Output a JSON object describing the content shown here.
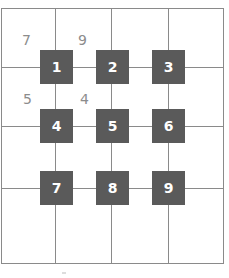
{
  "grid": {
    "columns": 4,
    "rows": 4,
    "line_color": "#8a8a8a"
  },
  "nodes": [
    {
      "label": "1"
    },
    {
      "label": "2"
    },
    {
      "label": "3"
    },
    {
      "label": "4"
    },
    {
      "label": "5"
    },
    {
      "label": "6"
    },
    {
      "label": "7"
    },
    {
      "label": "8"
    },
    {
      "label": "9"
    }
  ],
  "node_color": "#5a5a5a",
  "cell_labels": [
    {
      "label": "7"
    },
    {
      "label": "9"
    },
    {
      "label": "5"
    },
    {
      "label": "4"
    }
  ]
}
